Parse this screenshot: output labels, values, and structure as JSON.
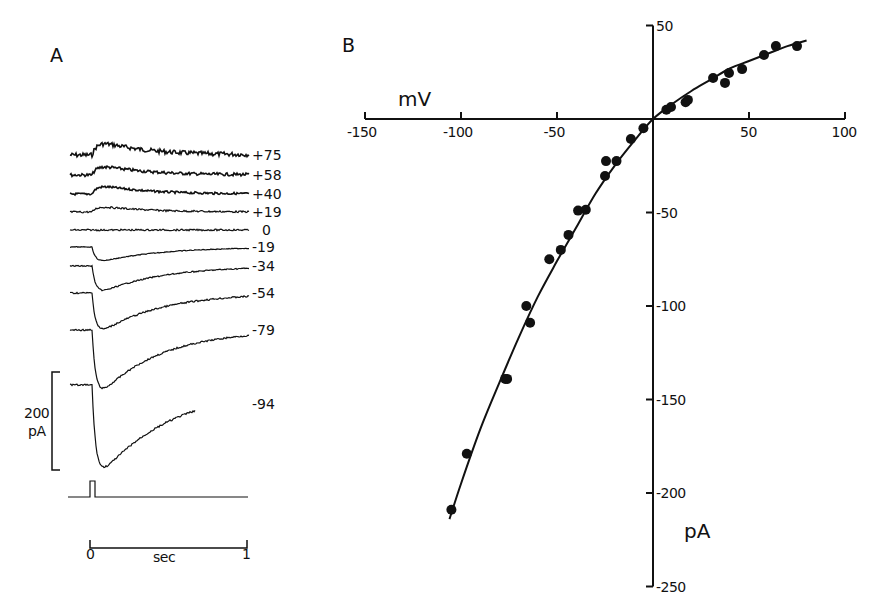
{
  "figure": {
    "panel_a_label": "A",
    "panel_b_label": "B"
  },
  "panel_a": {
    "scale_bar": {
      "value": "200",
      "unit": "pA"
    },
    "time_bar": {
      "start": "0",
      "unit": "sec",
      "end": "1"
    },
    "traces": [
      {
        "label": "+75",
        "baseline_y": 155,
        "amp": -14,
        "noise": 2.2
      },
      {
        "label": "+58",
        "baseline_y": 175,
        "amp": -10,
        "noise": 1.5
      },
      {
        "label": "+40",
        "baseline_y": 194,
        "amp": -9,
        "noise": 1.1
      },
      {
        "label": "+19",
        "baseline_y": 212,
        "amp": -6,
        "noise": 0.9
      },
      {
        "label": "0",
        "baseline_y": 230,
        "amp": 0,
        "noise": 0.8
      },
      {
        "label": "-19",
        "baseline_y": 247,
        "amp": 15,
        "noise": 0.4
      },
      {
        "label": "-34",
        "baseline_y": 266,
        "amp": 27,
        "noise": 0.6
      },
      {
        "label": "-54",
        "baseline_y": 293,
        "amp": 40,
        "noise": 0.8
      },
      {
        "label": "-79",
        "baseline_y": 330,
        "amp": 65,
        "noise": 0.8
      },
      {
        "label": "-94",
        "baseline_y": 385,
        "amp": 88,
        "noise": 0.9,
        "end_x": 195,
        "label_y": 404
      }
    ]
  },
  "chart_data": [
    {
      "type": "line",
      "panel": "A",
      "title": "Membrane current traces at different holding potentials",
      "xlabel": "sec",
      "x_ticks": [
        "0",
        "1"
      ],
      "scale_bar": "200 pA",
      "series_labels_mV": [
        "+75",
        "+58",
        "+40",
        "+19",
        "0",
        "-19",
        "-34",
        "-54",
        "-79",
        "-94"
      ],
      "approx_peak_current_pA": [
        29,
        21,
        19,
        13,
        0,
        -32,
        -58,
        -85,
        -139,
        -188
      ]
    },
    {
      "type": "scatter",
      "panel": "B",
      "title": "Current-voltage relation",
      "xlabel": "mV",
      "ylabel": "pA",
      "xlim": [
        -150,
        100
      ],
      "ylim": [
        -250,
        50
      ],
      "x_ticks": [
        -150,
        -100,
        -50,
        50,
        100
      ],
      "y_ticks": [
        50,
        -50,
        -100,
        -150,
        -200,
        -250
      ],
      "grid": false,
      "points": [
        [
          -105,
          -209
        ],
        [
          -97,
          -179
        ],
        [
          -77,
          -139
        ],
        [
          -76,
          -139
        ],
        [
          -66,
          -100
        ],
        [
          -64,
          -109
        ],
        [
          -54,
          -75
        ],
        [
          -48,
          -70
        ],
        [
          -44,
          -62
        ],
        [
          -39,
          -49
        ],
        [
          -35,
          -48.5
        ],
        [
          -25,
          -30.5
        ],
        [
          -24.5,
          -22.5
        ],
        [
          -19,
          -22.5
        ],
        [
          -11.5,
          -10.7
        ],
        [
          -5,
          -5
        ],
        [
          7,
          5
        ],
        [
          9.4,
          6.4
        ],
        [
          17,
          9
        ],
        [
          18.2,
          10.2
        ],
        [
          31.3,
          21.9
        ],
        [
          37.5,
          19.3
        ],
        [
          39.6,
          24.6
        ],
        [
          46.4,
          26.7
        ],
        [
          57.8,
          34.2
        ],
        [
          64,
          39
        ],
        [
          75,
          39
        ]
      ],
      "fit_curve": [
        [
          -106,
          -214
        ],
        [
          -100,
          -195
        ],
        [
          -90,
          -166
        ],
        [
          -80,
          -141
        ],
        [
          -70,
          -117
        ],
        [
          -60,
          -95
        ],
        [
          -50,
          -76
        ],
        [
          -40,
          -58
        ],
        [
          -30,
          -40
        ],
        [
          -20,
          -25
        ],
        [
          -10,
          -12
        ],
        [
          0,
          0
        ],
        [
          10,
          8
        ],
        [
          20,
          15
        ],
        [
          30,
          21
        ],
        [
          40,
          27
        ],
        [
          50,
          31
        ],
        [
          60,
          35
        ],
        [
          70,
          39
        ],
        [
          80,
          42
        ]
      ]
    }
  ]
}
